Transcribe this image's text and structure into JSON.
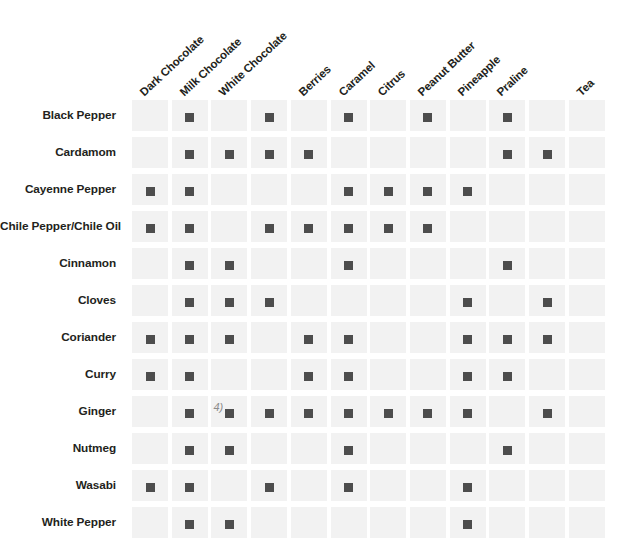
{
  "chart_data": {
    "type": "heatmap",
    "title": "",
    "xlabel": "",
    "ylabel": "",
    "grid": true,
    "legend": "none",
    "columns": [
      "Dark Chocolate",
      "Milk Chocolate",
      "White Chocolate",
      "Berries",
      "Caramel",
      "Citrus",
      "Peanut Butter",
      "Pineapple",
      "Praline",
      "Tea"
    ],
    "rows": [
      "Black Pepper",
      "Cardamom",
      "Cayenne Pepper",
      "Chile Pepper/Chile Oil",
      "Cinnamon",
      "Cloves",
      "Coriander",
      "Curry",
      "Ginger",
      "Nutmeg",
      "Wasabi",
      "White Pepper"
    ],
    "cell_column_count": 12,
    "matrix": [
      [
        0,
        1,
        0,
        1,
        0,
        1,
        0,
        1,
        0,
        1,
        0,
        0
      ],
      [
        0,
        1,
        1,
        1,
        1,
        0,
        0,
        0,
        0,
        1,
        1,
        0
      ],
      [
        1,
        1,
        0,
        0,
        0,
        1,
        1,
        1,
        1,
        0,
        0,
        0
      ],
      [
        1,
        1,
        0,
        1,
        1,
        1,
        1,
        1,
        0,
        0,
        0,
        0
      ],
      [
        0,
        1,
        1,
        0,
        0,
        1,
        0,
        0,
        0,
        1,
        0,
        0
      ],
      [
        0,
        1,
        1,
        1,
        0,
        0,
        0,
        0,
        1,
        0,
        1,
        0
      ],
      [
        1,
        1,
        1,
        0,
        1,
        1,
        0,
        0,
        1,
        1,
        1,
        0
      ],
      [
        1,
        1,
        0,
        0,
        1,
        1,
        0,
        0,
        1,
        1,
        0,
        0
      ],
      [
        0,
        1,
        1,
        1,
        1,
        1,
        1,
        1,
        1,
        0,
        1,
        0
      ],
      [
        0,
        1,
        1,
        0,
        0,
        1,
        0,
        0,
        0,
        1,
        0,
        0
      ],
      [
        1,
        1,
        0,
        1,
        0,
        1,
        0,
        0,
        1,
        0,
        0,
        0
      ],
      [
        0,
        1,
        1,
        0,
        0,
        0,
        0,
        0,
        1,
        0,
        0,
        0
      ]
    ],
    "mark_color": "#4d4d4d",
    "cell_background": "#f2f2f2",
    "page_background": "#ffffff",
    "text_color": "#231f20",
    "marks_meaning": "filled square = pairing exists"
  },
  "artifact": {
    "glyph": "4)",
    "row_index": 8,
    "note": "stray ink mark on the Ginger row"
  }
}
